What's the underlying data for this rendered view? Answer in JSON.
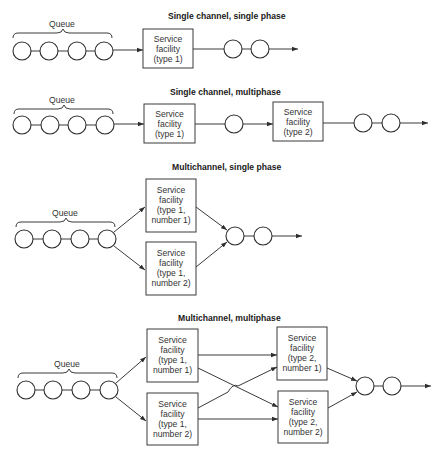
{
  "diagrams": [
    {
      "title": "Single channel, single phase",
      "queue_label": "Queue",
      "boxes": [
        {
          "lines": [
            "Service",
            "facility",
            "(type 1)"
          ]
        }
      ]
    },
    {
      "title": "Single channel, multiphase",
      "queue_label": "Queue",
      "boxes": [
        {
          "lines": [
            "Service",
            "facility",
            "(type 1)"
          ]
        },
        {
          "lines": [
            "Service",
            "facility",
            "(type 2)"
          ]
        }
      ]
    },
    {
      "title": "Multichannel, single phase",
      "queue_label": "Queue",
      "boxes": [
        {
          "lines": [
            "Service",
            "facility",
            "(type 1,",
            "number 1)"
          ]
        },
        {
          "lines": [
            "Service",
            "facility",
            "(type 1,",
            "number 2)"
          ]
        }
      ]
    },
    {
      "title": "Multichannel, multiphase",
      "queue_label": "Queue",
      "boxes": [
        {
          "lines": [
            "Service",
            "facility",
            "(type 1,",
            "number 1)"
          ]
        },
        {
          "lines": [
            "Service",
            "facility",
            "(type 1,",
            "number 2)"
          ]
        },
        {
          "lines": [
            "Service",
            "facility",
            "(type 2,",
            "number 1)"
          ]
        },
        {
          "lines": [
            "Service",
            "facility",
            "(type 2,",
            "number 2)"
          ]
        }
      ]
    }
  ]
}
